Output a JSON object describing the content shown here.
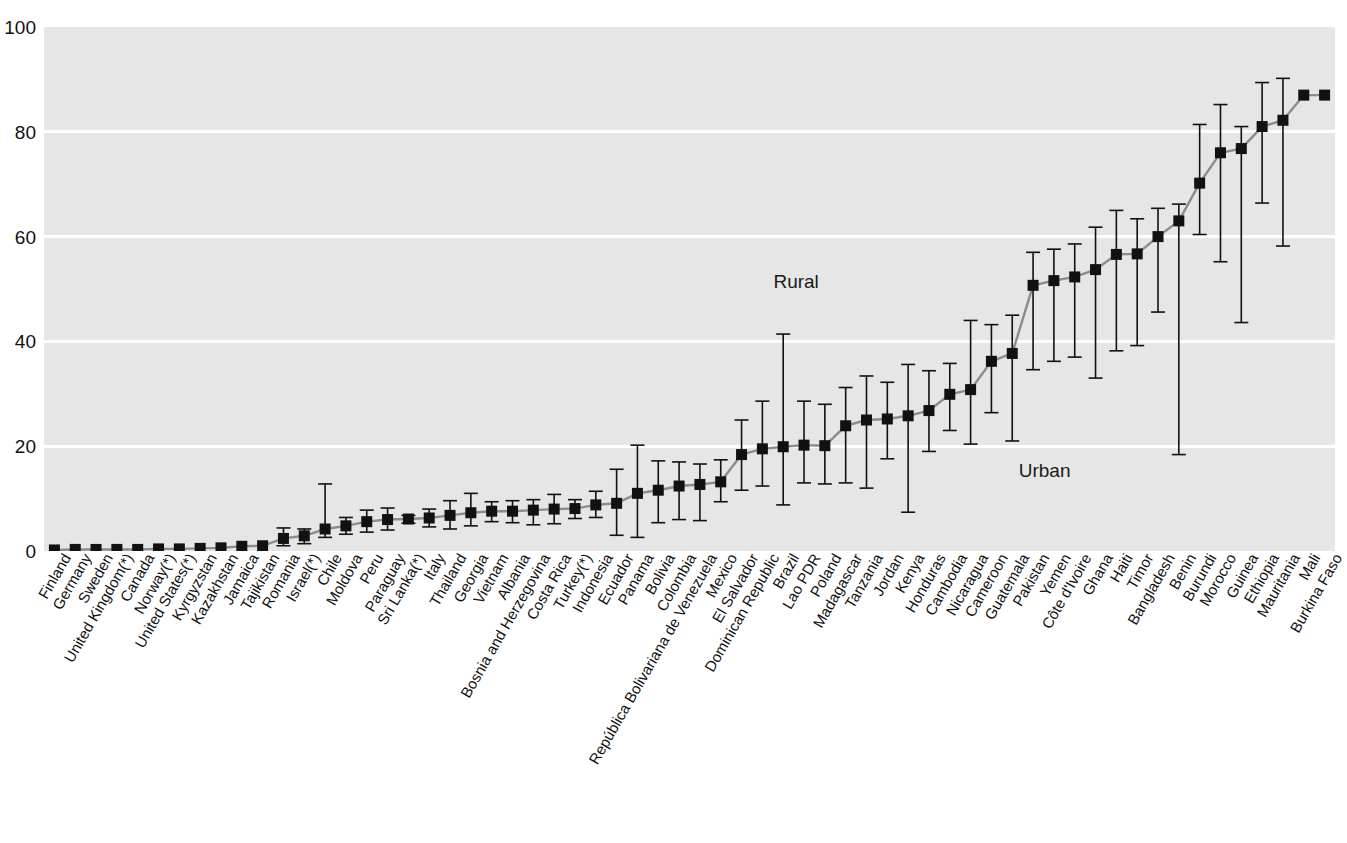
{
  "figure": {
    "title_clipped": "Figure",
    "background": "#e6e6e6",
    "marker_color": "#111111",
    "line_color": "#8c8c8c",
    "gridline_color": "#ffffff"
  },
  "annotations": [
    {
      "text": "Rural",
      "x_frac": 0.565,
      "y_value": 51.5
    },
    {
      "text": "Urban",
      "x_frac": 0.755,
      "y_value": 15.5
    }
  ],
  "chart_data": {
    "type": "scatter",
    "title": "",
    "xlabel": "",
    "ylabel": "",
    "ylim": [
      0,
      100
    ],
    "yticks": [
      0,
      20,
      40,
      60,
      80,
      100
    ],
    "grid": true,
    "legend_position": "inline-annotation",
    "error_bar_note": "vertical whiskers show urban (lower) to rural (upper) range; square marker is the national value",
    "categories": [
      "Finland",
      "Germany",
      "Sweden",
      "United Kingdom(*)",
      "Canada",
      "Norway(*)",
      "United States(*)",
      "Kyrgyzstan",
      "Kazakhstan",
      "Jamaica",
      "Tajikistan",
      "Romania",
      "Israel(*)",
      "Chile",
      "Moldova",
      "Peru",
      "Paraguay",
      "Sri Lanka(*)",
      "Italy",
      "Thailand",
      "Georgia",
      "Vietnam",
      "Albania",
      "Bosnia and Herzegovina",
      "Costa Rica",
      "Turkey(*)",
      "Indonesia",
      "Ecuador",
      "Panama",
      "Bolivia",
      "Colombia",
      "República Bolivariana de Venezuela",
      "Mexico",
      "El Salvador",
      "Dominican Republic",
      "Brazil",
      "Lao PDR",
      "Poland",
      "Madagascar",
      "Tanzania",
      "Jordan",
      "Kenya",
      "Honduras",
      "Cambodia",
      "Nicaragua",
      "Cameroon",
      "Guatemala",
      "Pakistan",
      "Yemen",
      "Côte d'Ivoire",
      "Ghana",
      "Haiti",
      "Timor",
      "Bangladesh",
      "Benin",
      "Burundi",
      "Morocco",
      "Guinea",
      "Ethiopia",
      "Mauritania",
      "Mali",
      "Burkina Faso"
    ],
    "values": [
      0.2,
      0.3,
      0.3,
      0.3,
      0.3,
      0.4,
      0.4,
      0.5,
      0.6,
      0.9,
      1.0,
      2.4,
      2.9,
      4.2,
      4.8,
      5.6,
      6.0,
      6.1,
      6.3,
      6.8,
      7.3,
      7.6,
      7.6,
      7.8,
      8.0,
      8.1,
      8.8,
      9.1,
      11.0,
      11.6,
      12.4,
      12.7,
      13.2,
      18.4,
      19.5,
      19.9,
      20.2,
      20.1,
      23.9,
      25.0,
      25.2,
      25.8,
      26.8,
      29.9,
      30.8,
      36.2,
      37.7,
      50.7,
      51.6,
      52.3,
      53.7,
      56.6,
      56.7,
      60.0,
      63.0,
      70.2,
      76.0,
      76.8,
      81.0,
      82.2,
      87.0,
      87.0
    ],
    "err_low": [
      0.2,
      0.3,
      0.3,
      0.3,
      0.3,
      0.4,
      0.4,
      0.5,
      0.6,
      0.9,
      1.0,
      1.0,
      1.4,
      2.6,
      3.2,
      3.6,
      4.0,
      5.3,
      4.6,
      4.2,
      4.8,
      5.6,
      5.4,
      5.0,
      5.2,
      6.2,
      6.4,
      3.0,
      2.6,
      5.4,
      6.0,
      5.8,
      9.4,
      11.6,
      12.4,
      8.8,
      13.0,
      12.8,
      13.0,
      12.0,
      17.6,
      7.4,
      19.0,
      23.0,
      20.4,
      26.4,
      21.0,
      34.6,
      36.2,
      37.0,
      33.0,
      38.2,
      39.2,
      45.6,
      18.4,
      60.4,
      55.2,
      43.6,
      66.4,
      58.2,
      87.0,
      87.0
    ],
    "err_high": [
      0.2,
      0.3,
      0.3,
      0.3,
      0.3,
      0.4,
      0.4,
      0.5,
      0.6,
      0.9,
      1.0,
      4.4,
      4.2,
      12.8,
      6.4,
      7.8,
      8.2,
      6.8,
      8.0,
      9.6,
      11.0,
      9.4,
      9.6,
      9.8,
      10.8,
      9.8,
      11.4,
      15.6,
      20.2,
      17.2,
      17.0,
      16.6,
      17.4,
      25.0,
      28.6,
      41.4,
      28.6,
      28.0,
      31.2,
      33.4,
      32.2,
      35.6,
      34.4,
      35.8,
      44.0,
      43.2,
      45.0,
      57.0,
      57.6,
      58.6,
      61.8,
      65.0,
      63.4,
      65.4,
      66.2,
      81.4,
      85.2,
      81.0,
      89.4,
      90.2,
      87.0,
      87.0
    ]
  }
}
